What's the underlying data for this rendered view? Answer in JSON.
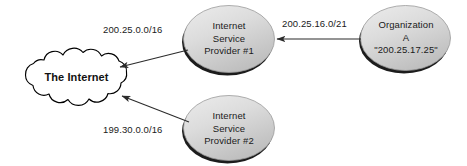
{
  "figure": {
    "type": "network-diagram",
    "width": 467,
    "height": 166,
    "background_color": "#ffffff"
  },
  "colors": {
    "ellipse_fill_light": "#e4e4e4",
    "ellipse_fill_dark": "#c4c4c4",
    "ellipse_stroke": "#9a9a9a",
    "ellipse_shadow": "#1c1c1c",
    "cloud_fill": "#ffffff",
    "cloud_stroke": "#000000",
    "arrow_color": "#2b2b2b",
    "text_color": "#1a1a1a"
  },
  "cloud": {
    "name": "the-internet-cloud",
    "label": "The Internet"
  },
  "nodes": [
    {
      "id": "isp1",
      "shape": "ellipse",
      "lines": [
        "Internet",
        "Service",
        "Provider #1"
      ]
    },
    {
      "id": "isp2",
      "shape": "ellipse",
      "lines": [
        "Internet",
        "Service",
        "Provider #2"
      ]
    },
    {
      "id": "org_a",
      "shape": "ellipse",
      "lines": [
        "Organization",
        "A",
        "\"200.25.17.25\""
      ]
    }
  ],
  "edges": [
    {
      "id": "isp1-to-internet",
      "from": "isp1",
      "to": "the-internet-cloud",
      "label": "200.25.0.0/16",
      "direction": "left-down"
    },
    {
      "id": "isp2-to-internet",
      "from": "isp2",
      "to": "the-internet-cloud",
      "label": "199.30.0.0/16",
      "direction": "left-up"
    },
    {
      "id": "org-a-to-isp1",
      "from": "org_a",
      "to": "isp1",
      "label": "200.25.16.0/21",
      "direction": "left"
    }
  ]
}
